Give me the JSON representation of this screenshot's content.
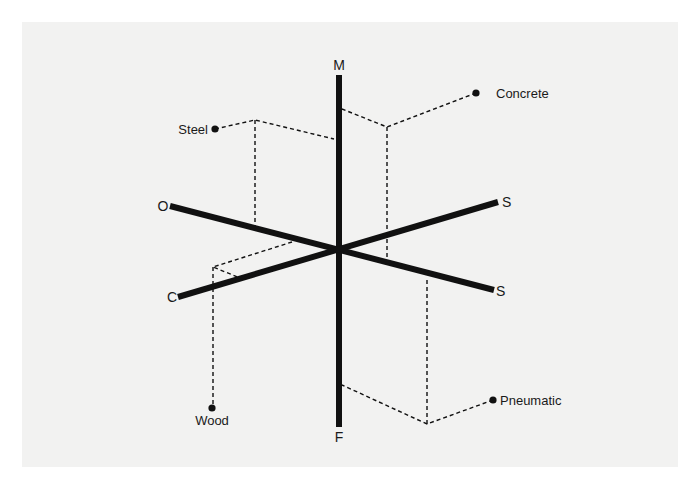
{
  "diagram": {
    "type": "six-axis material property diagram",
    "colors": {
      "background": "#f2f2f1",
      "ink": "#111111"
    },
    "center": {
      "x": 339,
      "y": 250
    },
    "axes": [
      {
        "id": "M",
        "label": "M",
        "direction": "up"
      },
      {
        "id": "F",
        "label": "F",
        "direction": "down"
      },
      {
        "id": "O",
        "label": "O",
        "direction": "upper-left"
      },
      {
        "id": "C",
        "label": "C",
        "direction": "lower-left"
      },
      {
        "id": "S_upper",
        "label": "S",
        "direction": "upper-right"
      },
      {
        "id": "S_lower",
        "label": "S",
        "direction": "lower-right"
      }
    ],
    "materials": [
      {
        "id": "steel",
        "label": "Steel",
        "connects_axes": [
          "M",
          "O"
        ]
      },
      {
        "id": "concrete",
        "label": "Concrete",
        "connects_axes": [
          "M",
          "S_lower"
        ]
      },
      {
        "id": "wood",
        "label": "Wood",
        "connects_axes": [
          "O",
          "C"
        ]
      },
      {
        "id": "pneumatic",
        "label": "Pneumatic",
        "connects_axes": [
          "F",
          "S_lower"
        ]
      }
    ]
  }
}
